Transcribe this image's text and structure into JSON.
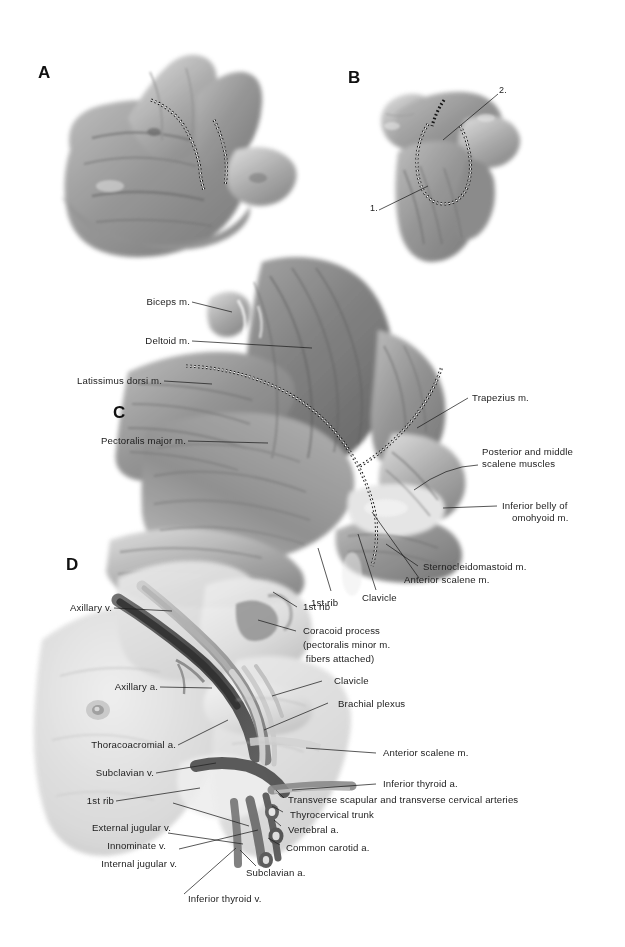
{
  "figure": {
    "type": "anatomical-illustration-plate",
    "background_color": "#ffffff",
    "ink_color": "#1c1c1c",
    "panel_count": 4
  },
  "panels": {
    "a": {
      "letter": "A"
    },
    "b": {
      "letter": "B"
    },
    "c": {
      "letter": "C"
    },
    "d": {
      "letter": "D"
    }
  },
  "panel_b_markers": {
    "one": "1.",
    "two": "2."
  },
  "panel_c_labels": {
    "biceps": "Biceps m.",
    "deltoid": "Deltoid m.",
    "latissimus": "Latissimus dorsi m.",
    "pectoralis_major": "Pectoralis major m.",
    "trapezius": "Trapezius m.",
    "scalene_post_mid_line1": "Posterior and middle",
    "scalene_post_mid_line2": "scalene muscles",
    "omohyoid_line1": "Inferior belly of",
    "omohyoid_line2": "omohyoid m.",
    "sternocleidomastoid": "Sternocleidomastoid m.",
    "anterior_scalene": "Anterior scalene m.",
    "clavicle": "Clavicle",
    "first_rib": "1st rib"
  },
  "panel_d_labels": {
    "axillary_v": "Axillary v.",
    "axillary_a": "Axillary a.",
    "thoracoacromial_a": "Thoracoacromial a.",
    "subclavian_v": "Subclavian v.",
    "first_rib": "1st rib",
    "external_jugular_v": "External jugular v.",
    "innominate_v": "Innominate v.",
    "internal_jugular_v": "Internal jugular v.",
    "inferior_thyroid_v": "Inferior thyroid v.",
    "subclavian_a": "Subclavian a.",
    "common_carotid_a": "Common carotid a.",
    "vertebral_a": "Vertebral a.",
    "thyrocervical_trunk": "Thyrocervical trunk",
    "transverse_arteries": "Transverse scapular and transverse cervical arteries",
    "inferior_thyroid_a": "Inferior thyroid a.",
    "anterior_scalene_m": "Anterior scalene m.",
    "brachial_plexus": "Brachial plexus",
    "clavicle": "Clavicle",
    "coracoid_line1": "Coracoid process",
    "coracoid_line2": "(pectoralis minor m.",
    "coracoid_line3": " fibers attached)",
    "first_rib_top": "1st rib"
  }
}
